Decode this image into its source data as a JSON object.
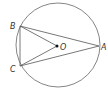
{
  "diagram": {
    "type": "geometry",
    "circle": {
      "center": "O",
      "cx": 58,
      "cy": 45,
      "r": 42
    },
    "points": {
      "A": {
        "label": "A",
        "x": 99,
        "y": 46
      },
      "B": {
        "label": "B",
        "x": 20,
        "y": 26
      },
      "C": {
        "label": "C",
        "x": 20,
        "y": 66
      },
      "O": {
        "label": "O",
        "x": 57,
        "y": 46
      }
    },
    "segments": [
      "AB",
      "BC",
      "CA",
      "OB",
      "OC"
    ],
    "colors": {
      "stroke": "#555555",
      "point": "#111111",
      "label": "#333333"
    }
  }
}
